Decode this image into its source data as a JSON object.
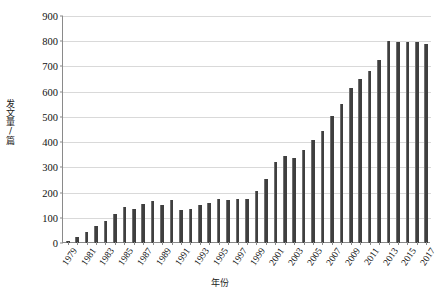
{
  "chart_data": {
    "type": "bar",
    "title": "",
    "xlabel": "年份",
    "ylabel": "发文量/篇",
    "ylim": [
      0,
      900
    ],
    "ytick_values": [
      0,
      100,
      200,
      300,
      400,
      500,
      600,
      700,
      800,
      900
    ],
    "ytick_labels": [
      "0",
      "100",
      "200",
      "300",
      "400",
      "500",
      "600",
      "700",
      "800",
      "900"
    ],
    "grid": true,
    "legend": "none",
    "bar_color": "#3f3f3f",
    "grid_color": "#d9d9d9",
    "axis_color": "#8a8a8a",
    "categories": [
      "1979",
      "1980",
      "1981",
      "1982",
      "1983",
      "1984",
      "1985",
      "1986",
      "1987",
      "1988",
      "1989",
      "1990",
      "1991",
      "1992",
      "1993",
      "1994",
      "1995",
      "1996",
      "1997",
      "1998",
      "1999",
      "2000",
      "2001",
      "2002",
      "2003",
      "2004",
      "2005",
      "2006",
      "2007",
      "2008",
      "2009",
      "2010",
      "2011",
      "2012",
      "2013",
      "2014",
      "2015",
      "2016",
      "2017"
    ],
    "values": [
      8,
      22,
      44,
      66,
      88,
      114,
      142,
      133,
      156,
      167,
      150,
      170,
      130,
      135,
      149,
      157,
      176,
      172,
      174,
      174,
      208,
      253,
      321,
      346,
      336,
      369,
      409,
      446,
      502,
      553,
      613,
      651,
      682,
      727,
      800,
      795,
      798,
      797,
      788
    ],
    "xtick_labels": [
      "1979",
      "1981",
      "1983",
      "1985",
      "1987",
      "1989",
      "1991",
      "1993",
      "1995",
      "1997",
      "1999",
      "2001",
      "2003",
      "2005",
      "2007",
      "2009",
      "2011",
      "2013",
      "2015",
      "2017"
    ]
  }
}
